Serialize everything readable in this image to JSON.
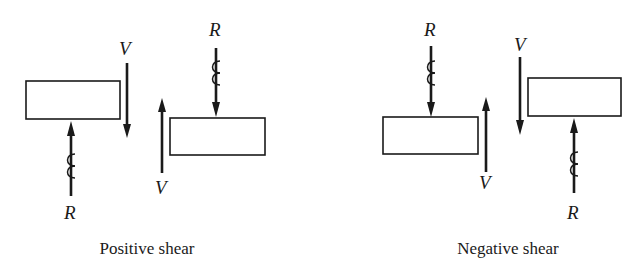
{
  "diagram": {
    "type": "beam shear sign convention",
    "colors": {
      "ink": "#1a1a1a",
      "background": "#ffffff"
    },
    "panels": [
      {
        "id": "positive",
        "caption": "Positive shear",
        "labels": {
          "v_top": "V",
          "v_bottom": "V",
          "r_top": "R",
          "r_bottom": "R"
        }
      },
      {
        "id": "negative",
        "caption": "Negative shear",
        "labels": {
          "v_top": "V",
          "v_bottom": "V",
          "r_top": "R",
          "r_bottom": "R"
        }
      }
    ]
  }
}
